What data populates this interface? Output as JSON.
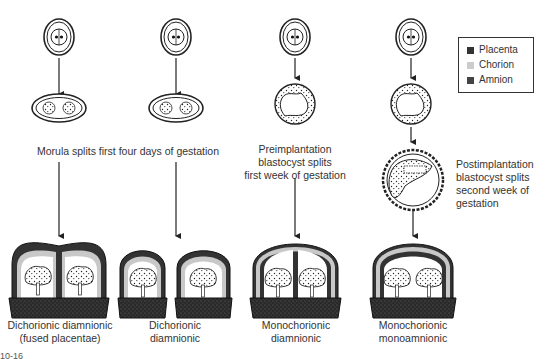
{
  "legend": {
    "items": [
      {
        "label": "Placenta",
        "color": "#333333"
      },
      {
        "label": "Chorion",
        "color": "#cccccc"
      },
      {
        "label": "Amnion",
        "color": "#444444"
      }
    ]
  },
  "stages": {
    "morula_split": "Morula splits first four days of gestation",
    "preimplantation": [
      "Preimplantation",
      "blastocyst splits",
      "first week of gestation"
    ],
    "postimplantation": [
      "Postimplantation",
      "blastocyst splits",
      "second week of",
      "gestation"
    ]
  },
  "outcomes": [
    {
      "line1": "Dichorionic diamnionic",
      "line2": "(fused placentae)"
    },
    {
      "line1": "Dichorionic",
      "line2": "diamnionic"
    },
    {
      "line1": "Monochorionic",
      "line2": "diamnionic"
    },
    {
      "line1": "Monochorionic",
      "line2": "monoamnionic"
    }
  ],
  "figure_label": "10-16"
}
